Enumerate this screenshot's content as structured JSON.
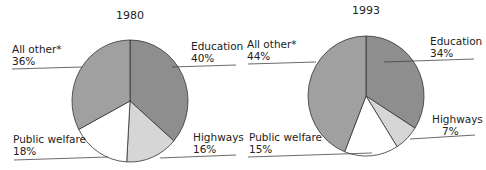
{
  "chart_data": [
    {
      "type": "pie",
      "title": "1980",
      "categories": [
        "Education",
        "Highways",
        "Public welfare",
        "All other*"
      ],
      "values": [
        40,
        16,
        18,
        36
      ],
      "labels": [
        "40%",
        "16%",
        "18%",
        "36%"
      ]
    },
    {
      "type": "pie",
      "title": "1993",
      "categories": [
        "Education",
        "Highways",
        "Public welfare",
        "All other*"
      ],
      "values": [
        34,
        7,
        15,
        44
      ],
      "labels": [
        "34%",
        "7%",
        "15%",
        "44%"
      ]
    }
  ],
  "colors": {
    "Education": "#8e8e8e",
    "Highways": "#d6d6d6",
    "Public welfare": "#ffffff",
    "All other*": "#a0a0a0",
    "stroke": "#333333"
  },
  "pie1980": {
    "title": "1980",
    "education": {
      "name": "Education",
      "pct": "40%"
    },
    "highways": {
      "name": "Highways",
      "pct": "16%"
    },
    "welfare": {
      "name": "Public welfare",
      "pct": "18%"
    },
    "other": {
      "name": "All other*",
      "pct": "36%"
    }
  },
  "pie1993": {
    "title": "1993",
    "education": {
      "name": "Education",
      "pct": "34%"
    },
    "highways": {
      "name": "Highways",
      "pct": "7%"
    },
    "welfare": {
      "name": "Public welfare",
      "pct": "15%"
    },
    "other": {
      "name": "All other*",
      "pct": "44%"
    }
  }
}
